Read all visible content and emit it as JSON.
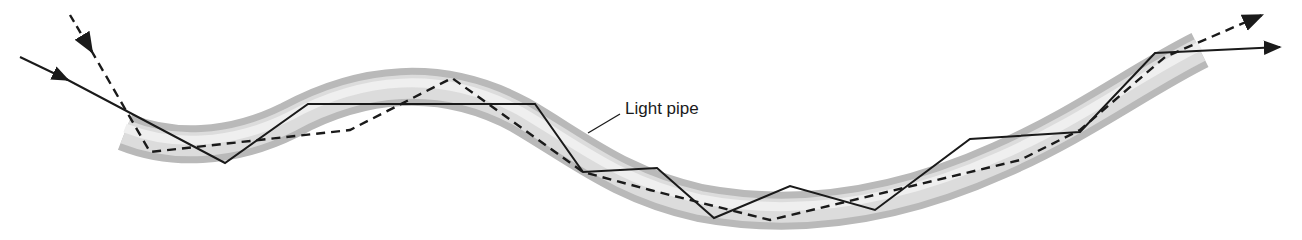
{
  "diagram": {
    "title": "",
    "labels": {
      "light_pipe": "Light pipe"
    },
    "colors": {
      "pipe_dark": "#b8b8b8",
      "pipe_light": "#e6e6e6",
      "ray": "#1a1a1a",
      "background": "#ffffff"
    },
    "rays": [
      {
        "name": "solid-ray",
        "style": "solid"
      },
      {
        "name": "dashed-ray",
        "style": "dashed"
      }
    ]
  }
}
